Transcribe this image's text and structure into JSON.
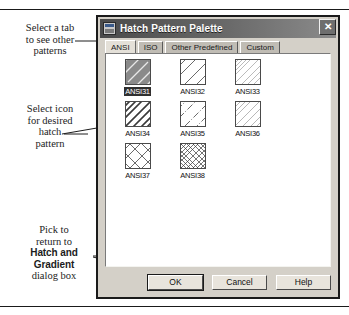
{
  "annotations": [
    {
      "name": "callout-select-tab",
      "lines": [
        "Select a tab",
        "to see other",
        "patterns"
      ]
    },
    {
      "name": "callout-select-icon",
      "lines": [
        "Select icon",
        "for desired",
        "hatch",
        "pattern"
      ]
    },
    {
      "name": "callout-pick-ok",
      "lines": [
        "Pick to",
        "return to"
      ],
      "bold_lines": [
        "Hatch and",
        "Gradient"
      ],
      "tail_lines": [
        "dialog box"
      ]
    }
  ],
  "dialog": {
    "title": "Hatch Pattern Palette",
    "title_icon": "hatch-palette-icon",
    "close_icon": "close-icon",
    "close_glyph": "✕",
    "tabs": [
      {
        "label": "ANSI",
        "active": true
      },
      {
        "label": "ISO",
        "active": false
      },
      {
        "label": "Other Predefined",
        "active": false
      },
      {
        "label": "Custom",
        "active": false
      }
    ],
    "patterns": [
      {
        "label": "ANSI31",
        "selected": true,
        "style": "diag-45-med"
      },
      {
        "label": "ANSI32",
        "selected": false,
        "style": "diag-45-wide-double"
      },
      {
        "label": "ANSI33",
        "selected": false,
        "style": "diag-45-fine"
      },
      {
        "label": "ANSI34",
        "selected": false,
        "style": "diag-45-dense"
      },
      {
        "label": "ANSI35",
        "selected": false,
        "style": "diag-45-dashdot"
      },
      {
        "label": "ANSI36",
        "selected": false,
        "style": "diag-45-fine2"
      },
      {
        "label": "ANSI37",
        "selected": false,
        "style": "cross-45-wide"
      },
      {
        "label": "ANSI38",
        "selected": false,
        "style": "cross-45-dense"
      }
    ],
    "buttons": [
      {
        "label": "OK",
        "default": true
      },
      {
        "label": "Cancel",
        "default": false
      },
      {
        "label": "Help",
        "default": false
      }
    ]
  },
  "colors": {
    "dialog_face": "#d4d0c8",
    "panel_bg": "#ffffff",
    "titlebar_dark": "#4a4a4a",
    "selection": "#303030",
    "ink": "#1c1c1c"
  }
}
